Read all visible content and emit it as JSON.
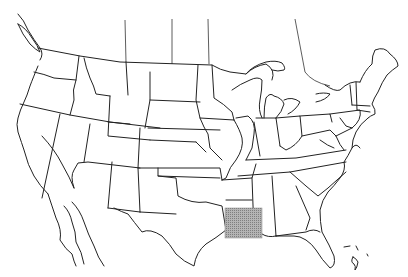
{
  "map": {
    "type": "outline map",
    "region": "United States (contiguous) with southern Canada border lines and northern Mexico",
    "highlight": {
      "shape": "rectangle",
      "fill_color": "#a0a0a0",
      "pattern": "dotted gray shading",
      "location_description": "Gulf Coast region covering Louisiana and southern Mississippi",
      "bbox_px": [
        225,
        208,
        262,
        238
      ]
    },
    "line_color": "#222222",
    "background": "#ffffff"
  }
}
